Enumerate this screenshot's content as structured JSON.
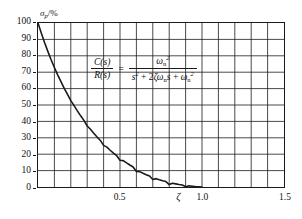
{
  "figure": {
    "y_axis_title_symbol": "σ",
    "y_axis_title_sub": "p",
    "y_axis_title_unit": "/%",
    "x_axis_symbol": "ζ"
  },
  "formula": {
    "numerator_left": "C(s)",
    "denominator_left": "R(s)",
    "equals": "=",
    "numerator_right_base": "ω",
    "numerator_right_sub": "n",
    "numerator_right_sup": "2",
    "denominator_right_s": "s",
    "denominator_right_s_sup": "2",
    "denominator_plus1": " + 2",
    "denominator_zeta": "ζ",
    "denominator_omega": "ω",
    "denominator_omega_sub": "n",
    "denominator_s2": "s",
    "denominator_plus2": " + ",
    "denominator_omega2": "ω",
    "denominator_omega2_sub": "n",
    "denominator_omega2_sup": "2"
  },
  "chart_data": {
    "type": "line",
    "title": "",
    "xlabel": "ζ",
    "ylabel": "σp/%",
    "xlim": [
      0,
      1.5
    ],
    "ylim": [
      0,
      100
    ],
    "grid": true,
    "legend": "none",
    "x_major_ticks": [
      0.5,
      1.0,
      1.5
    ],
    "x_major_tick_labels": [
      "0.5",
      "1.0",
      "1.5"
    ],
    "x_minor_gridline_step": 0.1,
    "y_ticks": [
      0,
      10,
      20,
      30,
      40,
      50,
      60,
      70,
      80,
      90,
      100
    ],
    "y_tick_labels": [
      "0",
      "10",
      "20",
      "30",
      "40",
      "50",
      "60",
      "70",
      "80",
      "90",
      "100"
    ],
    "series": [
      {
        "name": "percent overshoot",
        "color": "#1a1a1a",
        "x": [
          0.0,
          0.02,
          0.04,
          0.06,
          0.08,
          0.1,
          0.12,
          0.14,
          0.16,
          0.18,
          0.2,
          0.22,
          0.24,
          0.26,
          0.28,
          0.3,
          0.32,
          0.34,
          0.36,
          0.38,
          0.4,
          0.42,
          0.44,
          0.46,
          0.48,
          0.5,
          0.52,
          0.54,
          0.56,
          0.58,
          0.6,
          0.62,
          0.64,
          0.66,
          0.68,
          0.7,
          0.72,
          0.74,
          0.76,
          0.78,
          0.8,
          0.82,
          0.84,
          0.86,
          0.88,
          0.9,
          0.92,
          0.94,
          0.96,
          0.98,
          1.0
        ],
        "y": [
          100.0,
          93.9,
          88.1,
          82.7,
          77.6,
          72.9,
          68.4,
          64.2,
          60.2,
          56.5,
          52.7,
          49.6,
          46.4,
          43.4,
          40.6,
          37.2,
          35.2,
          32.8,
          30.5,
          28.4,
          25.4,
          24.3,
          22.4,
          20.7,
          19.1,
          16.3,
          16.1,
          14.7,
          13.4,
          12.2,
          9.5,
          9.4,
          8.4,
          7.5,
          6.7,
          4.6,
          5.1,
          4.4,
          3.8,
          3.3,
          1.5,
          2.3,
          1.9,
          1.5,
          1.2,
          0.2,
          0.7,
          0.5,
          0.3,
          0.2,
          0.0
        ]
      }
    ]
  }
}
